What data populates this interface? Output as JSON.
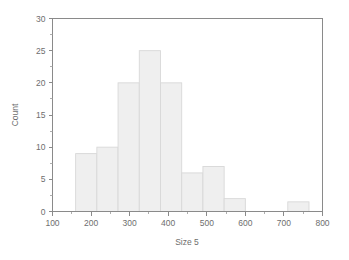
{
  "chart_data": {
    "type": "bar",
    "subtype": "histogram",
    "title": "",
    "xlabel": "Size 5",
    "ylabel": "Count",
    "xlim": [
      100,
      800
    ],
    "ylim": [
      0,
      30
    ],
    "xticks": [
      100,
      200,
      300,
      400,
      500,
      600,
      700,
      800
    ],
    "xtick_labels": [
      "100",
      "200",
      "300",
      "400",
      "500",
      "600",
      "700",
      "800"
    ],
    "yticks": [
      0,
      5,
      10,
      15,
      20,
      25,
      30
    ],
    "ytick_labels": [
      "0",
      "5",
      "10",
      "15",
      "20",
      "25",
      "30"
    ],
    "x_minor_tick_step": 50,
    "y_minor_tick_step": 2.5,
    "grid": false,
    "legend": null,
    "bin_width": 55,
    "bin_edges": [
      160,
      215,
      270,
      325,
      380,
      435,
      490,
      545,
      600,
      655,
      710,
      765
    ],
    "bins": [
      {
        "start": 160,
        "end": 215,
        "count": 9
      },
      {
        "start": 215,
        "end": 270,
        "count": 10
      },
      {
        "start": 270,
        "end": 325,
        "count": 20
      },
      {
        "start": 325,
        "end": 380,
        "count": 25
      },
      {
        "start": 380,
        "end": 435,
        "count": 20
      },
      {
        "start": 435,
        "end": 490,
        "count": 6
      },
      {
        "start": 490,
        "end": 545,
        "count": 7
      },
      {
        "start": 545,
        "end": 600,
        "count": 2
      },
      {
        "start": 600,
        "end": 655,
        "count": 0
      },
      {
        "start": 655,
        "end": 710,
        "count": 0
      },
      {
        "start": 710,
        "end": 765,
        "count": 1.5
      }
    ],
    "categories": [
      "160-215",
      "215-270",
      "270-325",
      "325-380",
      "380-435",
      "435-490",
      "490-545",
      "545-600",
      "600-655",
      "655-710",
      "710-765"
    ],
    "values": [
      9,
      10,
      20,
      25,
      20,
      6,
      7,
      2,
      0,
      0,
      1.5
    ],
    "colors": {
      "bar_fill": "#efefef",
      "bar_stroke": "#d8d8d8",
      "axis": "#8a8a8a",
      "text": "#6e6e6e",
      "background": "#ffffff"
    }
  }
}
